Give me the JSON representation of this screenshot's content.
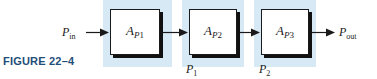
{
  "figure": {
    "caption": "FIGURE 22–4",
    "caption_color": "#1f4e79",
    "band_color": "#d6e9f5",
    "line_color": "#1a1a1a",
    "background": "#ffffff"
  },
  "diagram": {
    "type": "block-diagram",
    "stages": [
      {
        "symbol": "A",
        "subscript_italic": "P",
        "subscript_num": "1",
        "full_label": "A_P1"
      },
      {
        "symbol": "A",
        "subscript_italic": "P",
        "subscript_num": "2",
        "full_label": "A_P2"
      },
      {
        "symbol": "A",
        "subscript_italic": "P",
        "subscript_num": "3",
        "full_label": "A_P3"
      }
    ],
    "ports": {
      "input": {
        "symbol": "P",
        "subscript": "in",
        "full_label": "P_in"
      },
      "output": {
        "symbol": "P",
        "subscript": "out",
        "full_label": "P_out"
      }
    },
    "nodes": [
      {
        "symbol": "P",
        "subscript": "1",
        "full_label": "P_1"
      },
      {
        "symbol": "P",
        "subscript": "2",
        "full_label": "P_2"
      }
    ],
    "arrows": [
      {
        "name": "input-arrow",
        "direction": "right"
      },
      {
        "name": "stage1-to-stage2-arrow",
        "direction": "right"
      },
      {
        "name": "stage2-to-stage3-arrow",
        "direction": "right"
      },
      {
        "name": "output-arrow",
        "direction": "right"
      }
    ]
  }
}
